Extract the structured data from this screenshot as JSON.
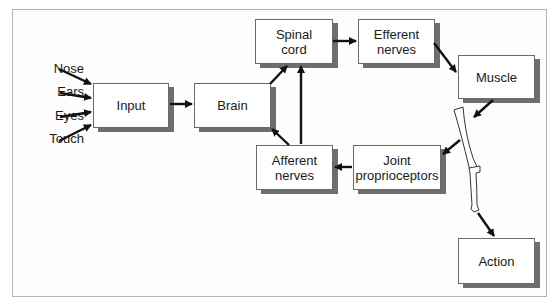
{
  "diagram": {
    "inputs": [
      "Nose",
      "Ears",
      "Eyes",
      "Touch"
    ],
    "boxes": {
      "input": "Input",
      "brain": "Brain",
      "spinal_cord": [
        "Spinal",
        "cord"
      ],
      "efferent_nerves": [
        "Efferent",
        "nerves"
      ],
      "muscle": "Muscle",
      "joint_proprioceptors": [
        "Joint",
        "proprioceptors"
      ],
      "afferent_nerves": [
        "Afferent",
        "nerves"
      ],
      "action": "Action"
    },
    "colors": {
      "box_border": "#6a6a6a",
      "shadow": "#6e6e6e",
      "arrow": "#111111",
      "frame": "#b4b4b4"
    }
  }
}
